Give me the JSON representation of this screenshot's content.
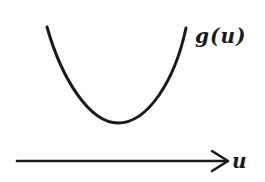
{
  "diagram": {
    "curve_label": "g(u)",
    "axis_label": "u",
    "colors": {
      "stroke": "#1a1a1a",
      "background": "#ffffff"
    },
    "curve": {
      "shape": "convex U-shaped parabola",
      "start": [
        47,
        27
      ],
      "minimum": [
        118,
        123
      ],
      "end": [
        186,
        28
      ]
    },
    "axis": {
      "start": [
        17,
        161
      ],
      "end": [
        228,
        161
      ],
      "arrowhead": "open chevron"
    }
  }
}
